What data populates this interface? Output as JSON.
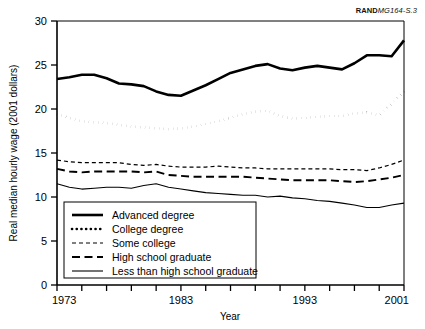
{
  "figure": {
    "source_note_bold": "RAND",
    "source_note_rest": "MG164-S.3"
  },
  "chart_data": {
    "type": "line",
    "title": "",
    "xlabel": "Year",
    "ylabel": "Real median hourly wage (2001 dollars)",
    "xlim": [
      1973,
      2001
    ],
    "ylim": [
      0,
      30
    ],
    "ytick_values": [
      0,
      5,
      10,
      15,
      20,
      25,
      30
    ],
    "ytick_labels": [
      "0",
      "5",
      "10",
      "15",
      "20",
      "25",
      "30"
    ],
    "xtick_values": [
      1973,
      1975,
      1977,
      1979,
      1981,
      1983,
      1985,
      1987,
      1989,
      1991,
      1993,
      1995,
      1997,
      1999,
      2001
    ],
    "xtick_labels_shown": [
      "1973",
      "1983",
      "1993",
      "2001"
    ],
    "xtick_labels_shown_at": [
      1973,
      1983,
      1993,
      2001
    ],
    "grid": false,
    "legend_position": "lower-left-inside",
    "x": [
      1973,
      1974,
      1975,
      1976,
      1977,
      1978,
      1979,
      1980,
      1981,
      1982,
      1983,
      1984,
      1985,
      1986,
      1987,
      1988,
      1989,
      1990,
      1991,
      1992,
      1993,
      1994,
      1995,
      1996,
      1997,
      1998,
      1999,
      2000,
      2001
    ],
    "series": [
      {
        "name": "Advanced degree",
        "style": "solid",
        "line_width": 2.6,
        "color": "#000000",
        "values": [
          23.4,
          23.6,
          23.9,
          23.9,
          23.5,
          22.9,
          22.8,
          22.6,
          22.0,
          21.6,
          21.5,
          22.1,
          22.7,
          23.4,
          24.1,
          24.5,
          24.9,
          25.1,
          24.6,
          24.4,
          24.7,
          24.9,
          24.7,
          24.5,
          25.2,
          26.1,
          26.1,
          26.0,
          27.8
        ]
      },
      {
        "name": "College degree",
        "style": "dotted",
        "line_width": 2.6,
        "color": "#000000",
        "values": [
          19.4,
          19.0,
          18.6,
          18.5,
          18.4,
          18.2,
          18.0,
          17.9,
          17.8,
          17.7,
          17.8,
          18.0,
          18.3,
          18.6,
          19.0,
          19.4,
          19.7,
          19.8,
          19.2,
          18.9,
          19.0,
          19.1,
          19.2,
          19.2,
          19.5,
          19.6,
          19.3,
          20.6,
          22.0
        ]
      },
      {
        "name": "Some college",
        "style": "short-dash",
        "line_width": 1.2,
        "color": "#000000",
        "values": [
          14.2,
          14.0,
          13.9,
          13.9,
          13.9,
          13.9,
          13.7,
          13.6,
          13.7,
          13.5,
          13.4,
          13.4,
          13.4,
          13.5,
          13.4,
          13.3,
          13.3,
          13.2,
          13.2,
          13.2,
          13.2,
          13.2,
          13.2,
          13.1,
          13.1,
          13.0,
          13.3,
          13.7,
          14.2
        ]
      },
      {
        "name": "High school graduate",
        "style": "long-dash",
        "line_width": 1.9,
        "color": "#000000",
        "values": [
          13.2,
          12.9,
          12.8,
          12.9,
          12.9,
          12.9,
          12.9,
          12.8,
          12.9,
          12.5,
          12.4,
          12.3,
          12.3,
          12.3,
          12.3,
          12.3,
          12.2,
          12.1,
          12.0,
          11.9,
          11.9,
          11.9,
          11.9,
          11.8,
          11.7,
          11.8,
          12.0,
          12.2,
          12.5
        ]
      },
      {
        "name": "Less than high school graduate",
        "style": "thin-solid",
        "line_width": 1.1,
        "color": "#000000",
        "values": [
          11.5,
          11.1,
          10.9,
          11.0,
          11.1,
          11.1,
          11.0,
          11.3,
          11.5,
          11.1,
          10.9,
          10.7,
          10.5,
          10.4,
          10.3,
          10.2,
          10.2,
          10.0,
          10.1,
          9.9,
          9.8,
          9.6,
          9.5,
          9.3,
          9.1,
          8.8,
          8.8,
          9.1,
          9.3
        ]
      }
    ]
  },
  "legend": {
    "items": [
      {
        "label": "Advanced degree"
      },
      {
        "label": "College degree"
      },
      {
        "label": "Some college"
      },
      {
        "label": "High school graduate"
      },
      {
        "label": "Less than high school graduate"
      }
    ]
  }
}
